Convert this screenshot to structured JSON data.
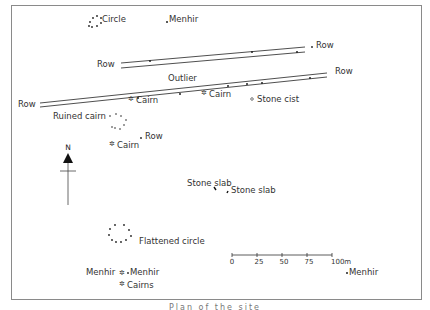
{
  "map": {
    "labels": {
      "circle": "Circle",
      "menhir_top": "Menhir",
      "row_upper_left": "Row",
      "row_upper_right": "Row",
      "outlier": "Outlier",
      "row_lower_right": "Row",
      "row_lower_left": "Row",
      "cairn_1": "Cairn",
      "cairn_2": "Cairn",
      "stone_cist": "Stone cist",
      "ruined_cairn": "Ruined cairn",
      "row_small": "Row",
      "cairn_3": "Cairn",
      "stone_slab_1": "Stone slab",
      "stone_slab_2": "Stone slab",
      "flattened_circle": "Flattened circle",
      "menhir_bl_left": "Menhir",
      "menhir_bl_right": "Menhir",
      "cairns": "Cairns",
      "menhir_br": "Menhir"
    },
    "north_arrow": {
      "label": "N"
    },
    "scale_bar": {
      "ticks": [
        "0",
        "25",
        "50",
        "75",
        "100m"
      ]
    },
    "caption": "Plan of the site"
  },
  "colors": {
    "ink": "#222222",
    "frame": "#8a8a8a",
    "background": "#ffffff"
  }
}
